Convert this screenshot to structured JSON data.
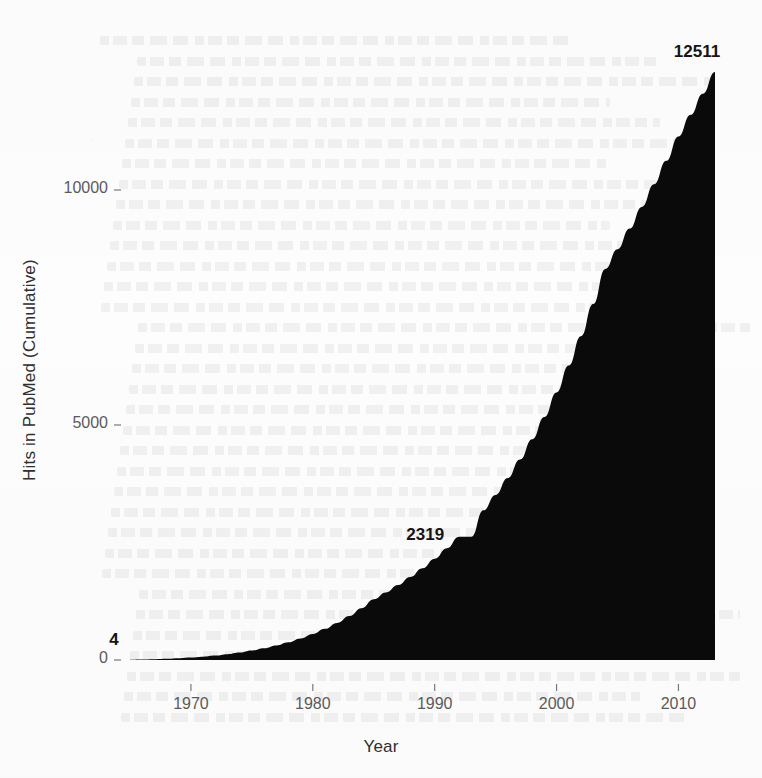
{
  "figure": {
    "background_color": "#fdfdfd",
    "area_fill_color": "#0a0a0a"
  },
  "axes": {
    "x_title": "Year",
    "y_title": "Hits in PubMed (Cumulative)",
    "x_ticks": [
      "1970",
      "1980",
      "1990",
      "2000",
      "2010"
    ],
    "y_ticks": [
      "0",
      "5000",
      "10000"
    ]
  },
  "annotations": [
    {
      "label": "4",
      "year": 1965,
      "value": 4
    },
    {
      "label": "2319",
      "year": 1993,
      "value": 2319
    },
    {
      "label": "12511",
      "year": 2013,
      "value": 12511
    }
  ],
  "chart_data": {
    "type": "area",
    "title": "",
    "xlabel": "Year",
    "ylabel": "Hits in PubMed (Cumulative)",
    "xlim": [
      1965,
      2013
    ],
    "ylim": [
      0,
      12511
    ],
    "x_tick_values": [
      1970,
      1980,
      1990,
      2000,
      2010
    ],
    "y_tick_values": [
      0,
      5000,
      10000
    ],
    "grid": false,
    "legend": null,
    "data_labels": [
      {
        "x": 1965,
        "y": 4,
        "text": "4"
      },
      {
        "x": 1993,
        "y": 2319,
        "text": "2319"
      },
      {
        "x": 2013,
        "y": 12511,
        "text": "12511"
      }
    ],
    "x": [
      1965,
      1966,
      1967,
      1968,
      1969,
      1970,
      1971,
      1972,
      1973,
      1974,
      1975,
      1976,
      1977,
      1978,
      1979,
      1980,
      1981,
      1982,
      1983,
      1984,
      1985,
      1986,
      1987,
      1988,
      1989,
      1990,
      1991,
      1992,
      1993,
      1994,
      1995,
      1996,
      1997,
      1998,
      1999,
      2000,
      2001,
      2002,
      2003,
      2004,
      2005,
      2006,
      2007,
      2008,
      2009,
      2010,
      2011,
      2012,
      2013
    ],
    "y": [
      4,
      9,
      16,
      25,
      37,
      52,
      71,
      95,
      124,
      159,
      201,
      251,
      310,
      379,
      460,
      554,
      663,
      789,
      934,
      1100,
      1290,
      1437,
      1595,
      1766,
      1952,
      2155,
      2377,
      2620,
      2319,
      3185,
      3512,
      3870,
      4264,
      4697,
      5172,
      5693,
      6264,
      6889,
      7573,
      8321,
      8740,
      9180,
      9640,
      10120,
      10620,
      11140,
      11600,
      12050,
      12511
    ],
    "series": [
      {
        "name": "Hits in PubMed (Cumulative)",
        "values": [
          4,
          9,
          16,
          25,
          37,
          52,
          71,
          95,
          124,
          159,
          201,
          251,
          310,
          379,
          460,
          554,
          663,
          789,
          934,
          1100,
          1290,
          1437,
          1595,
          1766,
          1952,
          2155,
          2377,
          2620,
          2319,
          3185,
          3512,
          3870,
          4264,
          4697,
          5172,
          5693,
          6264,
          6889,
          7573,
          8321,
          8740,
          9180,
          9640,
          10120,
          10620,
          11140,
          11600,
          12050,
          12511
        ]
      }
    ]
  },
  "geometry": {
    "plot_left_px": 130,
    "plot_right_px": 715,
    "baseline_y_px": 660,
    "y_10000_px": 190,
    "y_5000_px": 425,
    "y_0_px": 660
  }
}
